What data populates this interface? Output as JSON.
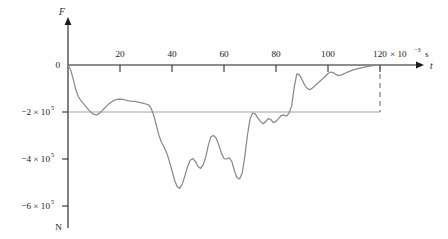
{
  "figure": {
    "background_color": "#ffffff",
    "curve_color": "#8a8a8a",
    "axis_color": "#1c1c1c",
    "grid_color": "#8d8d8d"
  },
  "axes": {
    "x_axis_name": "t",
    "y_axis_name": "F",
    "x_unit_text": "× 10",
    "x_unit_exponent": "−3",
    "x_unit_symbol": "s",
    "y_unit_label": "N",
    "zero_label": "0"
  },
  "chart_data": {
    "type": "line",
    "title": "",
    "subtitle": "",
    "xlabel": "t",
    "ylabel": "F",
    "x_unit": "× 10^-3 s",
    "y_unit": "N",
    "xlim": [
      0,
      125
    ],
    "ylim": [
      -660000,
      20000
    ],
    "grid": "single horizontal gridline at y = -2e5",
    "legend": "none",
    "x_tick_labels": [
      "20",
      "40",
      "60",
      "100"
    ],
    "x_tick_values": [
      20,
      40,
      60,
      80,
      100,
      120
    ],
    "x_tick_label_80": "80",
    "x_tick_label_120": "120",
    "y_tick_labels": [
      "0",
      "−2 × 10",
      "−4 × 10",
      "−6 × 10"
    ],
    "y_tick_exponent": "5",
    "y_tick_values": [
      0,
      -200000,
      -400000,
      -600000
    ],
    "annotations": [
      {
        "name": "terminal-dashed-line",
        "x": 120,
        "y_from": 0,
        "y_to": -200000,
        "style": "dashed"
      },
      {
        "name": "minus-2e5-gridline",
        "x_from": 0,
        "x_to": 120,
        "y": -200000,
        "style": "solid-thin"
      }
    ],
    "series": [
      {
        "name": "Impact force F(t)",
        "color": "#8a8a8a",
        "x": [
          0,
          1,
          2,
          3,
          4,
          5,
          6,
          7,
          8,
          9,
          10,
          11,
          12,
          13,
          14,
          15,
          16,
          17,
          18,
          19,
          20,
          21,
          22,
          23,
          24,
          25,
          26,
          27,
          28,
          29,
          30,
          31,
          32,
          33,
          34,
          35,
          36,
          37,
          38,
          39,
          40,
          41,
          42,
          43,
          44,
          45,
          46,
          47,
          48,
          49,
          50,
          51,
          52,
          53,
          54,
          55,
          56,
          57,
          58,
          59,
          60,
          61,
          62,
          63,
          64,
          65,
          66,
          67,
          68,
          69,
          70,
          71,
          72,
          73,
          74,
          75,
          76,
          77,
          78,
          79,
          80,
          81,
          82,
          83,
          84,
          85,
          86,
          87,
          88,
          89,
          90,
          91,
          92,
          93,
          94,
          95,
          96,
          97,
          98,
          99,
          100,
          101,
          102,
          103,
          104,
          105,
          106,
          107,
          108,
          109,
          110,
          112,
          114,
          116,
          118,
          120
        ],
        "y": [
          0,
          -20000,
          -60000,
          -105000,
          -135000,
          -152000,
          -165000,
          -178000,
          -192000,
          -203000,
          -210000,
          -212000,
          -207000,
          -196000,
          -184000,
          -173000,
          -163000,
          -155000,
          -149000,
          -146000,
          -145000,
          -146000,
          -149000,
          -152000,
          -154000,
          -155000,
          -155000,
          -158000,
          -160000,
          -163000,
          -166000,
          -170000,
          -185000,
          -215000,
          -258000,
          -300000,
          -330000,
          -350000,
          -375000,
          -410000,
          -450000,
          -490000,
          -518000,
          -525000,
          -505000,
          -470000,
          -432000,
          -405000,
          -398000,
          -410000,
          -432000,
          -440000,
          -425000,
          -390000,
          -340000,
          -305000,
          -300000,
          -312000,
          -340000,
          -375000,
          -398000,
          -400000,
          -395000,
          -410000,
          -450000,
          -480000,
          -485000,
          -460000,
          -390000,
          -300000,
          -230000,
          -205000,
          -208000,
          -225000,
          -240000,
          -250000,
          -242000,
          -228000,
          -232000,
          -245000,
          -240000,
          -228000,
          -215000,
          -212000,
          -218000,
          -205000,
          -175000,
          -95000,
          -38000,
          -42000,
          -62000,
          -85000,
          -100000,
          -105000,
          -98000,
          -88000,
          -78000,
          -68000,
          -58000,
          -48000,
          -36000,
          -30000,
          -32000,
          -40000,
          -45000,
          -43000,
          -38000,
          -33000,
          -28000,
          -24000,
          -20000,
          -14000,
          -9000,
          -5000,
          -2000,
          0
        ]
      }
    ]
  }
}
